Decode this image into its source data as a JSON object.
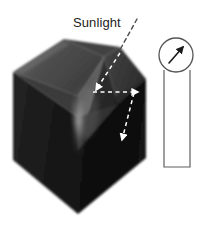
{
  "figure": {
    "background_color": "#ffffff",
    "width": 204,
    "height": 250
  },
  "labels": {
    "sunlight": "Sunlight"
  },
  "object": {
    "name": "cube-with-inverted-pyramid-cavity",
    "description": "Dark cube viewed in three-quarter perspective with a funnel shaped inverted pyramid cut into its top face",
    "colors": {
      "top_left_facet": "#4a4a4a",
      "top_right_facet": "#3b3b3b",
      "cavity_inner_left": "#6a6a6a",
      "cavity_inner_right": "#2e2e2e",
      "cavity_highlight": "#9a9a9a",
      "front_left_face": "#1b1b1b",
      "front_right_face": "#111111",
      "outline": "#2a2a2a"
    }
  },
  "annotations": {
    "sunlight_leader": {
      "name": "sunlight-leader-dashed-line",
      "style": "dashed",
      "color": "#3a3a3a"
    },
    "ray_incoming": {
      "name": "incoming-ray-arrow",
      "direction": "down-left",
      "style": "dashed",
      "color": "#ffffff"
    },
    "ray_horizontal": {
      "name": "horizontal-ray-arrow",
      "direction": "right",
      "style": "dashed",
      "color": "#ffffff"
    },
    "ray_reflected": {
      "name": "reflected-ray-arrow",
      "direction": "down-right",
      "style": "dashed",
      "color": "#ffffff"
    }
  },
  "inset": {
    "name": "direction-indicator",
    "shape": "circle",
    "arrow_direction": "northeast",
    "outline_color": "#555555",
    "fill_color": "#ffffff",
    "arrow_color": "#1a1a1a",
    "leader": {
      "name": "inset-bracket-leader",
      "color": "#5a5a5a"
    }
  }
}
